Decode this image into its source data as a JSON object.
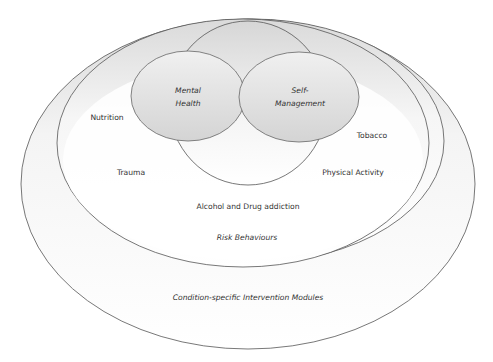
{
  "diagram": {
    "type": "nested-venn",
    "colors": {
      "stroke": "#555555",
      "text": "#333333",
      "fill_light": "#ffffff",
      "fill_shade": "#e2e2e2",
      "bubble_fill": "#dcdcdc"
    },
    "outer_ring": {
      "label": "Condition-specific Intervention Modules"
    },
    "middle_ring": {
      "label": "Risk Behaviours",
      "items": [
        "Nutrition",
        "Tobacco",
        "Trauma",
        "Physical Activity",
        "Alcohol and Drug addiction"
      ]
    },
    "core": {
      "left_bubble": {
        "line1": "Mental",
        "line2": "Health"
      },
      "right_bubble": {
        "line1": "Self-",
        "line2": "Management"
      }
    }
  }
}
